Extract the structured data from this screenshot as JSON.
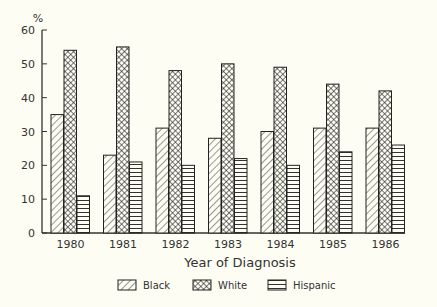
{
  "chart_data": {
    "type": "bar",
    "title": "",
    "xlabel": "Year of Diagnosis",
    "ylabel": "%",
    "ylim": [
      0,
      60
    ],
    "yticks": [
      0,
      10,
      20,
      30,
      40,
      50,
      60
    ],
    "grid": false,
    "legend_position": "bottom",
    "categories": [
      "1980",
      "1981",
      "1982",
      "1983",
      "1984",
      "1985",
      "1986"
    ],
    "series": [
      {
        "name": "Black",
        "pattern": "diagonal-hatch",
        "values": [
          35,
          23,
          31,
          28,
          30,
          31,
          31
        ]
      },
      {
        "name": "White",
        "pattern": "crosshatch",
        "values": [
          54,
          55,
          48,
          50,
          49,
          44,
          42
        ]
      },
      {
        "name": "Hispanic",
        "pattern": "horizontal-lines",
        "values": [
          11,
          21,
          20,
          22,
          20,
          24,
          26
        ]
      }
    ]
  },
  "legend": {
    "items": [
      {
        "label": "Black"
      },
      {
        "label": "White"
      },
      {
        "label": "Hispanic"
      }
    ]
  }
}
